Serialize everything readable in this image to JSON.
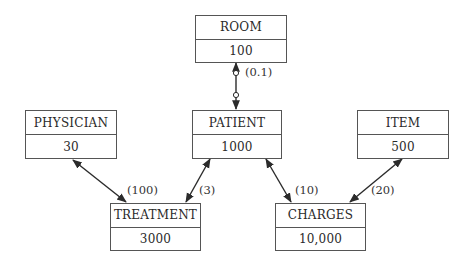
{
  "entities": {
    "room": {
      "name": "ROOM",
      "count": "100"
    },
    "patient": {
      "name": "PATIENT",
      "count": "1000"
    },
    "physician": {
      "name": "PHYSICIAN",
      "count": "30"
    },
    "item": {
      "name": "ITEM",
      "count": "500"
    },
    "treatment": {
      "name": "TREATMENT",
      "count": "3000"
    },
    "charges": {
      "name": "CHARGES",
      "count": "10,000"
    }
  },
  "relationships": [
    {
      "from": "ROOM",
      "to": "PATIENT",
      "label": "(0.1)",
      "style": "optional-both-ends"
    },
    {
      "from": "PHYSICIAN",
      "to": "TREATMENT",
      "label": "(100)",
      "style": "double-arrow"
    },
    {
      "from": "PATIENT",
      "to": "TREATMENT",
      "label": "(3)",
      "style": "double-arrow"
    },
    {
      "from": "PATIENT",
      "to": "CHARGES",
      "label": "(10)",
      "style": "double-arrow"
    },
    {
      "from": "ITEM",
      "to": "CHARGES",
      "label": "(20)",
      "style": "double-arrow"
    }
  ],
  "colors": {
    "line": "#2b2b2b",
    "border": "#555555",
    "background": "#ffffff"
  }
}
